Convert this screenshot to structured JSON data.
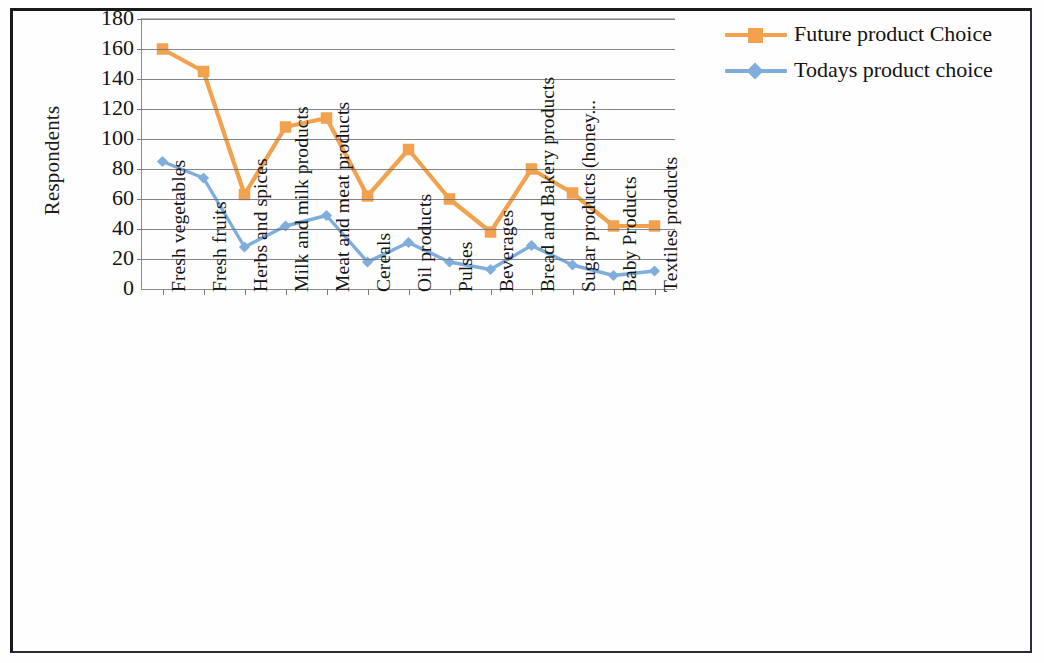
{
  "chart_data": {
    "type": "line",
    "title": "",
    "xlabel": "",
    "ylabel": "Respondents",
    "ylim": [
      0,
      180
    ],
    "yticks": [
      0,
      20,
      40,
      60,
      80,
      100,
      120,
      140,
      160,
      180
    ],
    "grid": true,
    "legend_position": "right",
    "categories": [
      "Fresh vegetables",
      "Fresh fruits",
      "Herbs and spices",
      "Milk and milk products",
      "Meat and meat products",
      "Cereals",
      "Oil products",
      "Pulses",
      "Beverages",
      "Bread and Bakery products",
      "Sugar products (honey...",
      "Baby Products",
      "Textiles products"
    ],
    "series": [
      {
        "name": "Future product Choice",
        "color": "#F2A24E",
        "marker": "square",
        "values": [
          160,
          145,
          63,
          108,
          114,
          62,
          93,
          60,
          38,
          80,
          64,
          42,
          42
        ]
      },
      {
        "name": "Todays product choice",
        "color": "#7FADDC",
        "marker": "diamond",
        "values": [
          85,
          74,
          28,
          42,
          49,
          18,
          31,
          18,
          13,
          29,
          16,
          9,
          12
        ]
      }
    ]
  },
  "axis": {
    "y_title": "Respondents",
    "y_tick_labels": [
      "180",
      "160",
      "140",
      "120",
      "100",
      "80",
      "60",
      "40",
      "20",
      "0"
    ]
  },
  "legend": {
    "items": [
      {
        "label": "Future product Choice",
        "color": "#F2A24E",
        "marker": "square"
      },
      {
        "label": "Todays product choice",
        "color": "#7FADDC",
        "marker": "diamond"
      }
    ]
  }
}
